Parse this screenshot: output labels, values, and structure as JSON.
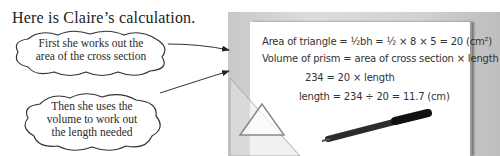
{
  "intro": "Here is Claire’s calculation.",
  "bubbles": [
    {
      "lines": [
        "First she works out the",
        "area of the cross section"
      ]
    },
    {
      "lines": [
        "Then she uses the",
        "volume to work out",
        "the length needed"
      ]
    }
  ],
  "calculation": {
    "line1": "Area of triangle = ½bh = ½ × 8 × 5 = 20 (cm²)",
    "line2": "Volume of prism = area of cross section × length",
    "line3": "234 = 20 × length",
    "line4": "length = 234 ÷ 20 = 11.7 (cm)"
  }
}
